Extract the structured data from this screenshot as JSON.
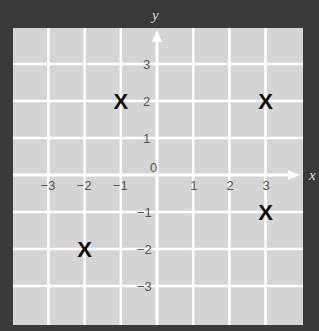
{
  "chart_data": {
    "type": "scatter",
    "title": "",
    "xlabel": "x",
    "ylabel": "y",
    "xlim": [
      -4,
      4
    ],
    "ylim": [
      -4,
      4
    ],
    "grid": true,
    "x_ticks": [
      "-3",
      "-2",
      "-1",
      "0",
      "1",
      "2",
      "3"
    ],
    "y_ticks": [
      "3",
      "2",
      "1",
      "-1",
      "-2",
      "-3"
    ],
    "marker": "X",
    "points": [
      {
        "x": -1,
        "y": 2
      },
      {
        "x": 3,
        "y": 2
      },
      {
        "x": 3,
        "y": -1
      },
      {
        "x": -2,
        "y": -2
      }
    ]
  },
  "colors": {
    "background": "#3a3a3a",
    "grid_panel": "#d4d4d4",
    "grid_lines": "#ffffff",
    "marker": "#111111",
    "tick_labels": "#555555",
    "axis_labels": "#dddddd"
  }
}
